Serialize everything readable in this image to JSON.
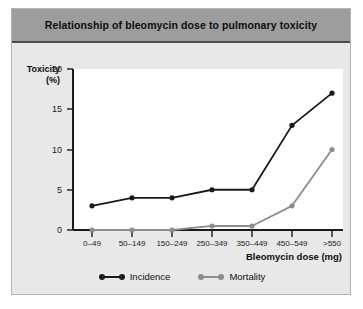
{
  "figure": {
    "title": "Relationship of bleomycin dose to pulmonary toxicity"
  },
  "axes": {
    "ylabel_main": "Toxicity",
    "ylabel_unit": "(%)",
    "xlabel": "Bleomycin dose (mg)",
    "yticks": [
      "0",
      "5",
      "10",
      "15",
      "20"
    ],
    "xticks": [
      "0–49",
      "50–149",
      "150–249",
      "250–349",
      "350–449",
      "450–549",
      ">550"
    ]
  },
  "legend": {
    "items": [
      {
        "label": "Incidence",
        "color": "#1a1a1a"
      },
      {
        "label": "Mortality",
        "color": "#8d8d8d"
      }
    ]
  },
  "colors": {
    "panel_bg": "#e8e8e8",
    "title_bar": "#9d9d9d",
    "plot_bg": "#ffffff",
    "incidence": "#1a1a1a",
    "mortality": "#8d8d8d"
  },
  "chart_data": {
    "type": "line",
    "title": "Relationship of bleomycin dose to pulmonary toxicity",
    "xlabel": "Bleomycin dose (mg)",
    "ylabel": "Toxicity (%)",
    "categories": [
      "0–49",
      "50–149",
      "150–249",
      "250–349",
      "350–449",
      "450–549",
      ">550"
    ],
    "ylim": [
      0,
      20
    ],
    "yticks": [
      0,
      5,
      10,
      15,
      20
    ],
    "grid": false,
    "legend_position": "bottom-center",
    "series": [
      {
        "name": "Incidence",
        "color": "#1a1a1a",
        "values": [
          3,
          4,
          4,
          5,
          5,
          13,
          17
        ]
      },
      {
        "name": "Mortality",
        "color": "#8d8d8d",
        "values": [
          0,
          0,
          0,
          0.5,
          0.5,
          3,
          10
        ]
      }
    ]
  }
}
